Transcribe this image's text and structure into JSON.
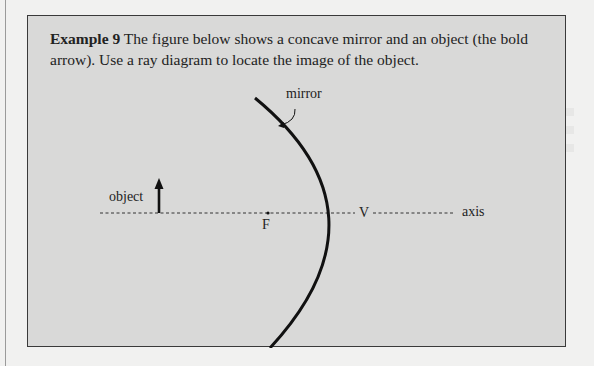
{
  "example": {
    "label": "Example 9",
    "text": " The figure below shows a concave mirror and an object (the bold arrow). Use a ray diagram to locate the image of the object."
  },
  "diagram": {
    "labels": {
      "mirror": "mirror",
      "object": "object",
      "focal_point": "F",
      "vertex": "V",
      "axis": "axis"
    },
    "colors": {
      "box_background": "#d9d9d8",
      "ink": "#111111"
    }
  }
}
